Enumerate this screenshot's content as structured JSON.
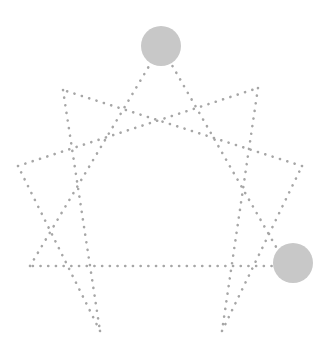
{
  "diagram": {
    "type": "enneagram",
    "points": [
      {
        "id": "9",
        "x": 161,
        "y": 46
      },
      {
        "id": "1",
        "x": 258,
        "y": 88
      },
      {
        "id": "2",
        "x": 302,
        "y": 166
      },
      {
        "id": "3",
        "x": 287,
        "y": 266
      },
      {
        "id": "4",
        "x": 222,
        "y": 331
      },
      {
        "id": "5",
        "x": 100,
        "y": 331
      },
      {
        "id": "6",
        "x": 30,
        "y": 266
      },
      {
        "id": "7",
        "x": 18,
        "y": 166
      },
      {
        "id": "8",
        "x": 63,
        "y": 90
      }
    ],
    "lines": [
      [
        "9",
        "3"
      ],
      [
        "3",
        "6"
      ],
      [
        "6",
        "9"
      ],
      [
        "1",
        "4"
      ],
      [
        "4",
        "2"
      ],
      [
        "2",
        "8"
      ],
      [
        "8",
        "5"
      ],
      [
        "5",
        "7"
      ],
      [
        "7",
        "1"
      ]
    ],
    "highlighted": [
      {
        "id": "9",
        "x": 161,
        "y": 46,
        "r": 20
      },
      {
        "id": "3",
        "x": 293,
        "y": 263,
        "r": 20
      }
    ],
    "colors": {
      "line": "#a6a6a6",
      "highlight": "#c8c8c8"
    }
  }
}
